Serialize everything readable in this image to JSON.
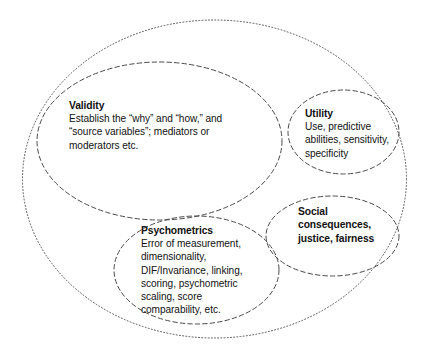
{
  "diagram": {
    "background_color": "#ffffff",
    "stroke_color": "#4a4a4a",
    "text_color": "#111111",
    "regions": {
      "outer": {
        "name": "outer-boundary",
        "label": "",
        "style": "dotted"
      },
      "validity": {
        "name": "validity",
        "heading": "Validity",
        "lines": [
          "Establish the “why” and “how,” and",
          "“source variables”; mediators or",
          "moderators etc."
        ],
        "style": "dashed"
      },
      "utility": {
        "name": "utility",
        "heading": "Utility",
        "lines": [
          "Use, predictive",
          "abilities, sensitivity,",
          "specificity"
        ],
        "style": "dashed"
      },
      "psychometrics": {
        "name": "psychometrics",
        "heading": "Psychometrics",
        "lines": [
          "Error of measurement,",
          "dimensionality,",
          "DIF/Invariance, linking,",
          "scoring, psychometric",
          "scaling, score",
          "comparability, etc."
        ],
        "style": "dashed"
      },
      "social": {
        "name": "social-consequences",
        "heading": "Social",
        "lines": [
          "consequences,",
          "justice, fairness"
        ],
        "style": "dashed"
      }
    }
  }
}
